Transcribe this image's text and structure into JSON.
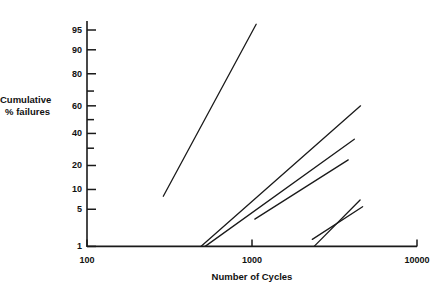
{
  "chart_data": {
    "type": "line",
    "title": "",
    "xlabel": "Number of Cycles",
    "ylabel": "Cumulative\n% failures",
    "xscale": "log",
    "yscale": "probability",
    "xlim": [
      100,
      10000
    ],
    "ylim": [
      1,
      99
    ],
    "grid": false,
    "legend": "none",
    "xticks": [
      {
        "value": 100,
        "label": "100"
      },
      {
        "value": 1000,
        "label": "1000"
      },
      {
        "value": 10000,
        "label": "10000"
      }
    ],
    "yticks": [
      {
        "value": 1,
        "label": "1"
      },
      {
        "value": 5,
        "label": "5"
      },
      {
        "value": 10,
        "label": "10"
      },
      {
        "value": 20,
        "label": "20"
      },
      {
        "value": 30,
        "label": ""
      },
      {
        "value": 40,
        "label": "40"
      },
      {
        "value": 50,
        "label": ""
      },
      {
        "value": 60,
        "label": "60"
      },
      {
        "value": 70,
        "label": ""
      },
      {
        "value": 80,
        "label": "80"
      },
      {
        "value": 90,
        "label": "90"
      },
      {
        "value": 95,
        "label": "95"
      }
    ],
    "series": [
      {
        "name": "line-1",
        "points": [
          {
            "x": 290,
            "y": 8
          },
          {
            "x": 1060,
            "y": 96
          }
        ]
      },
      {
        "name": "line-2",
        "points": [
          {
            "x": 490,
            "y": 1.0
          },
          {
            "x": 4550,
            "y": 60
          }
        ]
      },
      {
        "name": "line-3",
        "points": [
          {
            "x": 520,
            "y": 1.0
          },
          {
            "x": 4170,
            "y": 36
          }
        ]
      },
      {
        "name": "line-4",
        "points": [
          {
            "x": 1040,
            "y": 3.4
          },
          {
            "x": 3830,
            "y": 23
          }
        ]
      },
      {
        "name": "line-5",
        "points": [
          {
            "x": 2380,
            "y": 1.0
          },
          {
            "x": 4520,
            "y": 7.0
          }
        ]
      },
      {
        "name": "line-6",
        "points": [
          {
            "x": 2320,
            "y": 1.4
          },
          {
            "x": 4680,
            "y": 5.5
          }
        ]
      }
    ]
  },
  "axis": {
    "y_title": "Cumulative\n% failures",
    "x_title": "Number of Cycles",
    "x_tick_labels": [
      "100",
      "1000",
      "10000"
    ],
    "y_tick_labels": [
      "95",
      "90",
      "80",
      "60",
      "40",
      "20",
      "10",
      "5",
      "1"
    ]
  },
  "style": {
    "line_color": "#1a1a1a",
    "axis_color": "#1a1a1a",
    "background": "#ffffff",
    "text_color": "#111111"
  }
}
